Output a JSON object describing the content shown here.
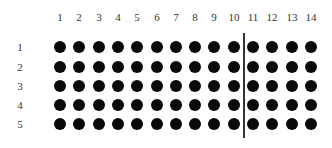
{
  "diagram": {
    "type": "dot-array",
    "columns": [
      "1",
      "2",
      "3",
      "4",
      "5",
      "6",
      "7",
      "8",
      "9",
      "10",
      "11",
      "12",
      "13",
      "14"
    ],
    "rows": [
      "1",
      "2",
      "3",
      "4",
      "5"
    ],
    "dot_color": "#0a0a0a",
    "divider_after_column": 10,
    "layout": {
      "col_x": [
        60,
        79,
        99,
        118,
        137,
        157,
        176,
        195,
        214,
        234,
        253,
        272,
        292,
        311
      ],
      "row_y": [
        47,
        67,
        86,
        105,
        124
      ]
    }
  }
}
